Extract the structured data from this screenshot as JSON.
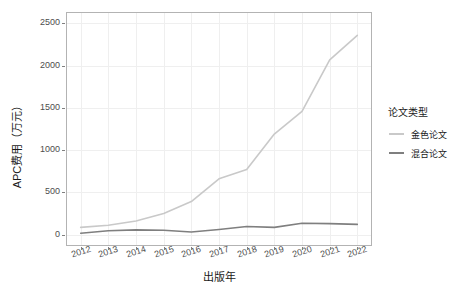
{
  "chart_data": {
    "type": "line",
    "title": "",
    "xlabel": "出版年",
    "ylabel": "APC费用（万元）",
    "x": [
      2012,
      2013,
      2014,
      2015,
      2016,
      2017,
      2018,
      2019,
      2020,
      2021,
      2022
    ],
    "xtick_labels": [
      "2012",
      "2013",
      "2014",
      "2015",
      "2016",
      "2017",
      "2018",
      "2019",
      "2020",
      "2021",
      "2022"
    ],
    "ytick_labels": [
      "0",
      "500",
      "1000",
      "1500",
      "2000",
      "2500"
    ],
    "yticks": [
      0,
      500,
      1000,
      1500,
      2000,
      2500
    ],
    "ylim": [
      0,
      2500
    ],
    "xlim": [
      2012,
      2022
    ],
    "grid": true,
    "legend_position": "right",
    "series": [
      {
        "name": "金色论文",
        "color": "#c9c9c9",
        "values": [
          85,
          110,
          160,
          250,
          390,
          660,
          770,
          1190,
          1460,
          2070,
          2360
        ]
      },
      {
        "name": "混合论文",
        "color": "#7f7f7f",
        "values": [
          15,
          45,
          55,
          50,
          30,
          60,
          95,
          85,
          135,
          130,
          120
        ]
      }
    ]
  },
  "legend": {
    "title": "论文类型",
    "items": [
      {
        "label": "金色论文",
        "color": "#c9c9c9"
      },
      {
        "label": "混合论文",
        "color": "#7f7f7f"
      }
    ]
  },
  "axes": {
    "y_title": "APC费用（万元）",
    "x_title": "出版年"
  }
}
